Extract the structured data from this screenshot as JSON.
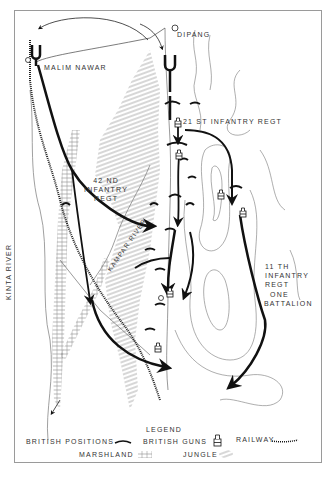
{
  "map": {
    "places": {
      "malim_nawar": "MALIM NAWAR",
      "dipang": "DIPANG"
    },
    "units": {
      "regt_21": "21 ST INFANTRY REGT",
      "regt_42_line1": "42 ND",
      "regt_42_line2": "INFANTRY",
      "regt_42_line3": "REGT",
      "regt_11_line1": "11 TH",
      "regt_11_line2": "INFANTRY",
      "regt_11_line3": "REGT",
      "battalion_line1": "ONE",
      "battalion_line2": "BATTALION"
    },
    "rivers": {
      "kinta": "KINTA RIVER",
      "kampar": "KAMPAR RIVER"
    }
  },
  "legend": {
    "title": "LEGEND",
    "items": [
      {
        "label": "BRITISH POSITIONS",
        "icon": "british-position-arc"
      },
      {
        "label": "BRITISH GUNS",
        "icon": "gun-symbol"
      },
      {
        "label": "RAILWAY",
        "icon": "railway-line"
      },
      {
        "label": "MARSHLAND",
        "icon": "marshland-hatch"
      },
      {
        "label": "JUNGLE",
        "icon": "jungle-hatch"
      }
    ]
  }
}
